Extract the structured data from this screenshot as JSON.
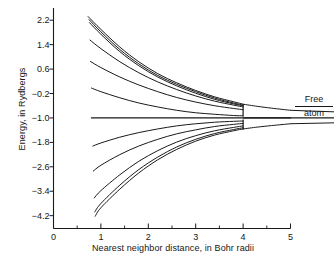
{
  "chart_data": {
    "type": "line",
    "title": "",
    "xlabel": "Nearest neighbor distance, in Bohr radii",
    "ylabel": "Energy, in Rydbergs",
    "xlim": [
      0,
      5
    ],
    "ylim": [
      -4.6,
      2.6
    ],
    "xticks": [
      0,
      1,
      2,
      3,
      4,
      5
    ],
    "xtick_labels": [
      "0",
      "1",
      "2",
      "3",
      "4",
      "5"
    ],
    "xminor_ticks": [
      0.5,
      1.5,
      2.5,
      3.5,
      4.5
    ],
    "yticks": [
      2.2,
      1.4,
      0.6,
      -0.2,
      -1.0,
      -1.8,
      -2.6,
      -3.4,
      -4.2
    ],
    "ytick_labels": [
      "2.2",
      "1.4",
      "0.6",
      "-0.2",
      "-1.0",
      "-1.8",
      "-2.6",
      "-3.4",
      "-4.2"
    ],
    "grid": false,
    "legend": false,
    "annotations": [
      {
        "name": "free-atom-level",
        "text_top": "Free",
        "text_bottom": "atom",
        "y_value": -1.0,
        "x_value": 5.0
      }
    ],
    "free_atom_level": -1.0,
    "line_color": "#1a1a1a",
    "series": [
      {
        "name": "upper-band-1",
        "x": [
          0.73,
          1.0,
          1.4,
          1.8,
          2.2,
          2.6,
          3.0,
          3.4,
          3.8,
          4.0
        ],
        "y": [
          2.32,
          1.9,
          1.32,
          0.84,
          0.45,
          0.15,
          -0.1,
          -0.31,
          -0.47,
          -0.55
        ]
      },
      {
        "name": "upper-band-2",
        "x": [
          0.75,
          1.0,
          1.4,
          1.8,
          2.2,
          2.6,
          3.0,
          3.4,
          3.8,
          4.0
        ],
        "y": [
          2.22,
          1.82,
          1.24,
          0.77,
          0.39,
          0.1,
          -0.14,
          -0.35,
          -0.51,
          -0.58
        ]
      },
      {
        "name": "upper-band-3",
        "x": [
          0.76,
          1.0,
          1.4,
          1.8,
          2.2,
          2.6,
          3.0,
          3.4,
          3.8,
          4.0
        ],
        "y": [
          2.12,
          1.74,
          1.17,
          0.71,
          0.34,
          0.05,
          -0.19,
          -0.39,
          -0.54,
          -0.6
        ]
      },
      {
        "name": "upper-band-4",
        "x": [
          0.77,
          1.0,
          1.4,
          1.8,
          2.2,
          2.6,
          3.0,
          3.4,
          3.8,
          4.0
        ],
        "y": [
          1.55,
          1.27,
          0.84,
          0.48,
          0.18,
          -0.07,
          -0.28,
          -0.45,
          -0.58,
          -0.64
        ]
      },
      {
        "name": "upper-band-5",
        "x": [
          0.78,
          1.0,
          1.4,
          1.8,
          2.2,
          2.6,
          3.0,
          3.4,
          3.8,
          4.0
        ],
        "y": [
          0.85,
          0.65,
          0.34,
          0.08,
          -0.14,
          -0.33,
          -0.48,
          -0.6,
          -0.69,
          -0.73
        ]
      },
      {
        "name": "upper-band-6",
        "x": [
          0.8,
          1.0,
          1.4,
          1.8,
          2.2,
          2.6,
          3.0,
          3.4,
          3.8,
          4.0
        ],
        "y": [
          -0.02,
          -0.14,
          -0.34,
          -0.51,
          -0.64,
          -0.75,
          -0.83,
          -0.88,
          -0.92,
          -0.93
        ]
      },
      {
        "name": "free-atom-line",
        "x": [
          0.8,
          2.0,
          3.5,
          4.0,
          5.0
        ],
        "y": [
          -1.0,
          -1.0,
          -1.0,
          -1.0,
          -1.0
        ]
      },
      {
        "name": "lower-band-1",
        "x": [
          0.83,
          1.0,
          1.4,
          1.8,
          2.2,
          2.6,
          3.0,
          3.4,
          3.8,
          4.0
        ],
        "y": [
          -1.92,
          -1.82,
          -1.63,
          -1.48,
          -1.36,
          -1.26,
          -1.19,
          -1.14,
          -1.11,
          -1.1
        ]
      },
      {
        "name": "lower-band-2",
        "x": [
          0.84,
          1.0,
          1.4,
          1.8,
          2.2,
          2.6,
          3.0,
          3.4,
          3.8,
          4.0
        ],
        "y": [
          -2.74,
          -2.55,
          -2.2,
          -1.92,
          -1.7,
          -1.52,
          -1.39,
          -1.28,
          -1.21,
          -1.18
        ]
      },
      {
        "name": "lower-band-3",
        "x": [
          0.86,
          1.0,
          1.4,
          1.8,
          2.2,
          2.6,
          3.0,
          3.4,
          3.8,
          4.0
        ],
        "y": [
          -3.62,
          -3.38,
          -2.86,
          -2.42,
          -2.07,
          -1.79,
          -1.58,
          -1.42,
          -1.31,
          -1.26
        ]
      },
      {
        "name": "lower-band-4",
        "x": [
          0.87,
          1.0,
          1.4,
          1.8,
          2.2,
          2.6,
          3.0,
          3.4,
          3.8,
          4.0
        ],
        "y": [
          -4.08,
          -3.8,
          -3.2,
          -2.69,
          -2.28,
          -1.95,
          -1.7,
          -1.51,
          -1.38,
          -1.32
        ]
      },
      {
        "name": "lower-band-5",
        "x": [
          0.88,
          1.0,
          1.4,
          1.8,
          2.2,
          2.6,
          3.0,
          3.4,
          3.8,
          4.0
        ],
        "y": [
          -4.22,
          -3.94,
          -3.33,
          -2.8,
          -2.37,
          -2.03,
          -1.76,
          -1.56,
          -1.42,
          -1.36
        ]
      },
      {
        "name": "tail-upper",
        "x": [
          4.0,
          4.3,
          4.6,
          5.0
        ],
        "y": [
          -0.55,
          -0.62,
          -0.68,
          -0.75
        ]
      },
      {
        "name": "tail-lower",
        "x": [
          4.0,
          4.3,
          4.6,
          5.0
        ],
        "y": [
          -1.36,
          -1.3,
          -1.25,
          -1.19
        ]
      }
    ]
  },
  "axis": {
    "ylabel": "Energy, in Rydbergs",
    "xlabel": "Nearest neighbor distance, in Bohr radii"
  },
  "free_atom": {
    "top": "Free",
    "bottom": "atom"
  }
}
